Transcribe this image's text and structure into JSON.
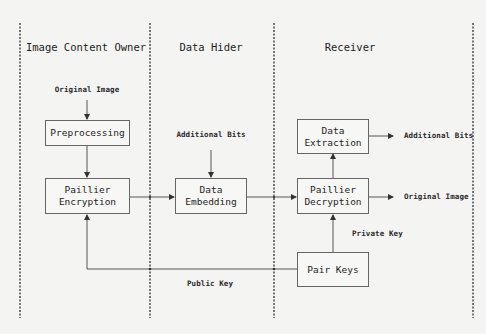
{
  "lanes": [
    {
      "title": "Image Content Owner"
    },
    {
      "title": "Data Hider"
    },
    {
      "title": "Receiver"
    }
  ],
  "boxes": {
    "preprocessing": {
      "line1": "Preprocessing",
      "line2": ""
    },
    "paillier_encryption": {
      "line1": "Paillier",
      "line2": "Encryption"
    },
    "data_embedding": {
      "line1": "Data",
      "line2": "Embedding"
    },
    "data_extraction": {
      "line1": "Data",
      "line2": "Extraction"
    },
    "paillier_decryption": {
      "line1": "Paillier",
      "line2": "Decryption"
    },
    "pair_keys": {
      "line1": "Pair Keys",
      "line2": ""
    }
  },
  "labels": {
    "original_image_input": "Original Image",
    "additional_bits_input": "Additional Bits",
    "additional_bits_output": "Additional Bits",
    "original_image_output": "Original Image",
    "private_key": "Private Key",
    "public_key": "Public Key"
  },
  "colors": {
    "background": "#f4f4f2",
    "line": "#444444",
    "box_border": "#666666"
  }
}
